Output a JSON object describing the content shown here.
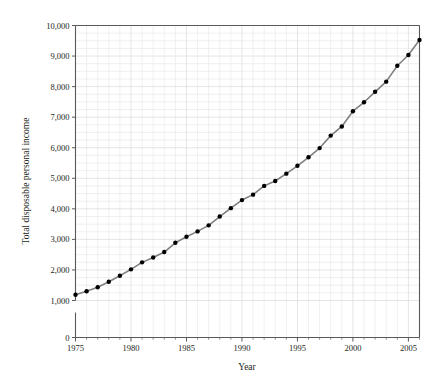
{
  "chart_data": {
    "type": "line",
    "title": "",
    "xlabel": "Year",
    "ylabel": "Total disposable personal income",
    "xlim": [
      1975,
      2006
    ],
    "ylim": [
      0,
      10000
    ],
    "grid": true,
    "legend_position": "none",
    "x_ticks": [
      1975,
      1980,
      1985,
      1990,
      1995,
      2000,
      2005
    ],
    "x_tick_labels": [
      "1975",
      "1980",
      "1985",
      "1990",
      "1995",
      "2000",
      "2005"
    ],
    "x_minor_step": 1,
    "y_ticks": [
      0,
      1000,
      2000,
      3000,
      4000,
      5000,
      6000,
      7000,
      8000,
      9000,
      10000
    ],
    "y_tick_labels": [
      "0",
      "1,000",
      "2,000",
      "3,000",
      "4,000",
      "5,000",
      "6,000",
      "7,000",
      "8,000",
      "9,000",
      "10,000"
    ],
    "y_axis_break_between": [
      0,
      1000
    ],
    "y_minor_step": 250,
    "colors": {
      "line": "#808080",
      "marker": "#000000",
      "axis": "#58595b",
      "grid": "#e9eaec",
      "grid_major": "#dcdee0",
      "text": "#231f20",
      "background": "#ffffff"
    },
    "marker": "circle",
    "marker_size": 4,
    "line_width": 1.6,
    "x": [
      1975,
      1976,
      1977,
      1978,
      1979,
      1980,
      1981,
      1982,
      1983,
      1984,
      1985,
      1986,
      1987,
      1988,
      1989,
      1990,
      1991,
      1992,
      1993,
      1994,
      1995,
      1996,
      1997,
      1998,
      1999,
      2000,
      2001,
      2002,
      2003,
      2004,
      2005,
      2006
    ],
    "values": [
      1187,
      1302,
      1436,
      1614,
      1808,
      2019,
      2248,
      2406,
      2586,
      2888,
      3086,
      3262,
      3460,
      3748,
      4022,
      4286,
      4465,
      4751,
      4912,
      5152,
      5408,
      5688,
      5988,
      6396,
      6695,
      7194,
      7487,
      7830,
      8163,
      8681,
      9036,
      9523
    ],
    "series": [
      {
        "name": "Total disposable personal income",
        "values": [
          1187,
          1302,
          1436,
          1614,
          1808,
          2019,
          2248,
          2406,
          2586,
          2888,
          3086,
          3262,
          3460,
          3748,
          4022,
          4286,
          4465,
          4751,
          4912,
          5152,
          5408,
          5688,
          5988,
          6396,
          6695,
          7194,
          7487,
          7830,
          8163,
          8681,
          9036,
          9523
        ]
      }
    ]
  }
}
